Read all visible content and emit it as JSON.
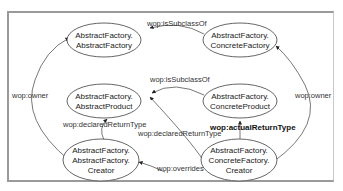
{
  "diagram": {
    "nodes": [
      {
        "id": "af_abstractfactory",
        "line1": "AbstractFactory.",
        "line2": "AbstractFactory",
        "line3": ""
      },
      {
        "id": "af_concretefactory",
        "line1": "AbstractFactory.",
        "line2": "ConcreteFactory",
        "line3": ""
      },
      {
        "id": "af_abstractproduct",
        "line1": "AbstractFactory.",
        "line2": "AbstractProduct",
        "line3": ""
      },
      {
        "id": "af_concreteproduct",
        "line1": "AbstractFactory.",
        "line2": "ConcreteProduct",
        "line3": ""
      },
      {
        "id": "af_af_creator",
        "line1": "AbstractFactory.",
        "line2": "AbstractFactory.",
        "line3": "Creator"
      },
      {
        "id": "af_cf_creator",
        "line1": "AbstractFactory.",
        "line2": "ConcreteFactory.",
        "line3": "Creator"
      }
    ],
    "edges": [
      {
        "from": "af_concretefactory",
        "to": "af_abstractfactory",
        "label": "wop:isSubclassOf"
      },
      {
        "from": "af_concreteproduct",
        "to": "af_abstractproduct",
        "label": "wop:isSubclassOf"
      },
      {
        "from": "af_af_creator",
        "to": "af_abstractfactory",
        "label": "wop:owner"
      },
      {
        "from": "af_cf_creator",
        "to": "af_concretefactory",
        "label": "wop:owner"
      },
      {
        "from": "af_af_creator",
        "to": "af_abstractproduct",
        "label": "wop:declaredReturnType"
      },
      {
        "from": "af_cf_creator",
        "to": "af_abstractproduct",
        "label": "wop:declaredReturnType"
      },
      {
        "from": "af_cf_creator",
        "to": "af_concreteproduct",
        "label": "wop:actualReturnType"
      },
      {
        "from": "af_cf_creator",
        "to": "af_af_creator",
        "label": "wop:overrides"
      }
    ]
  }
}
